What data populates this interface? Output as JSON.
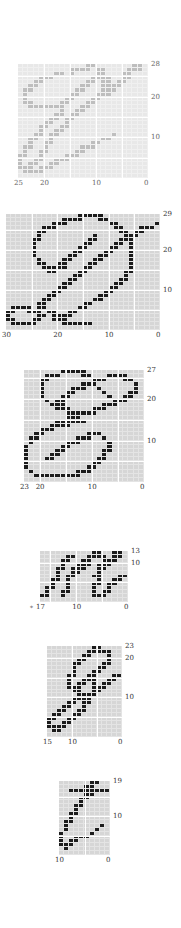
{
  "figure": {
    "colors": {
      "background": "#ffffff",
      "grid_bg": "#d6d6d6",
      "grid_line": "#ffffff",
      "ink": "#1c1c1c",
      "faded_ink": "#8a8a8a"
    },
    "panels": [
      {
        "id": "g1",
        "faded": true,
        "cols": 25,
        "rows": 28,
        "x": 18,
        "y": 64,
        "w": 130,
        "h": 114,
        "x_ticks": [
          "25",
          "20",
          "10",
          "0"
        ],
        "y_ticks": [
          "28",
          "20",
          "10"
        ],
        "bitmap": [
          ".............XX.......XX.",
          "..........XXXX.XX....XXX.",
          ".......XX.X....XX...XX...",
          "....XXX.......XXXX..XX...",
          "...XX........XX.XX.XX....",
          "..XX........XX..XXXX.....",
          ".XX........XX...XXX......",
          ".X........XX...XXX.......",
          ".X.......XX...XX.........",
          ".XX.....XX...XX..........",
          "..XXXXXXX...XX...........",
          "........X..XX............",
          ".......XX.XX.............",
          "......XX.XX..............",
          ".....XX..X...............",
          "....XX..XX...............",
          "....X..XX................",
          "...XX.XX..........X......",
          "..XX..X.........XX.......",
          "..X..XX.......XX.........",
          ".XX..X......XXX..........",
          ".X..XX.....XX............",
          "XX..X....XXX.............",
          "X..XX..XXX...............",
          "X.XX..XX.................",
          "XXX.XXX..................",
          ".XXXX....................",
          "........................."
        ]
      },
      {
        "id": "g2",
        "faded": false,
        "cols": 30,
        "rows": 29,
        "x": 6,
        "y": 214,
        "w": 154,
        "h": 116,
        "x_ticks": [
          "30",
          "20",
          "10",
          "0"
        ],
        "y_ticks": [
          "29",
          "20",
          "10"
        ],
        "bitmap": [
          "..............XXXXX...........",
          "...........XXXX...XX..........",
          ".........XXX........XX.......X",
          ".......XXX...........XX...XXX.",
          "......XX..............XX.XX...",
          "......X..........X.....XXX....",
          ".....XX.........XX....XXX.....",
          ".....X.........XX....XX.X.....",
          ".....X........XX....XX..X.....",
          ".....X.......XX....XX...X.....",
          ".....X......XX....XX....X.....",
          "......X....XX....XX.....X.....",
          "......XX..XX....XX......X.....",
          ".......XXXXX...XX.......X.....",
          "........XX....XX.......XX.....",
          ".............XX........X......",
          "............XX........XX......",
          "...........XX........XX.......",
          "..........XX........XX........",
          ".........XX........XX.........",
          "........XX........XX..........",
          ".......XX........XX...........",
          "......XX.......XX.............",
          ".XXXX.XX......XX..............",
          "XX..XXX.XX..XX................",
          "X.....XX.XXXX.................",
          "XX...XX..XXX..................",
          ".XXXXX.....XXXXXX.............",
          ".............................."
        ]
      },
      {
        "id": "g3",
        "faded": false,
        "cols": 23,
        "rows": 27,
        "x": 24,
        "y": 370,
        "w": 120,
        "h": 112,
        "x_ticks": [
          "23",
          "20",
          "10",
          "0"
        ],
        "y_ticks": [
          "27",
          "20",
          "10"
        ],
        "bitmap": [
          ".......XXXXX...........",
          "....XXX....XX...XXXX...",
          "...XX........XXX...XX..",
          "...X.......XXX.......X.",
          "...X.....XXX..X......X.",
          "...X....XX.....X....XX.",
          "...X...XX.......X..XX..",
          "....X.XX.........XXX...",
          ".....XXX.......XXX.....",
          "......XXX....XXX.......",
          "........XXXXXX.........",
          "........XXX............",
          "......XXXXXX...........",
          ".....XXXX..............",
          "...XXX.................",
          "..XX........XXX........",
          ".XX.......XXX..X.......",
          ".X......XXX.....X......",
          "X......XX.......X......",
          "X.....XX.......XX......",
          "X....XX........X.......",
          "X...XX........XX.......",
          "X............XX........",
          "X...........XX.........",
          ".X........XXX..........",
          "..XXXXXXXXX............",
          "......................."
        ]
      },
      {
        "id": "g4",
        "faded": false,
        "cols": 17,
        "rows": 13,
        "x": 40,
        "y": 551,
        "w": 88,
        "h": 51,
        "x_ticks": [
          "17",
          "10",
          "0"
        ],
        "y_ticks": [
          "13",
          "10"
        ],
        "star": "*",
        "bitmap": [
          "..........XX..XX.",
          ".....XX..XXXX.XX.",
          "....XX..XX..XXX..",
          "....X..XXX.XXX...",
          "...XX.XXX..XX....",
          "...X..XX...X.....",
          "...X.XX...XX...XX",
          "..XX.X.....X..XX.",
          "..X..X....XX.XX..",
          ".XX..X....X..X...",
          ".X..XX....X.XX...",
          "XX..X.....XXX....",
          "................."
        ]
      },
      {
        "id": "g5",
        "faded": false,
        "cols": 15,
        "rows": 23,
        "x": 47,
        "y": 646,
        "w": 75,
        "h": 91,
        "x_ticks": [
          "15",
          "10",
          "0"
        ],
        "y_ticks": [
          "23",
          "20"
        ],
        "y_ticks_lower": [
          "10"
        ],
        "bitmap": [
          ".........XX....",
          "........XXXXX..",
          ".......XX...X..",
          "......XX....X..",
          ".....XX....XX..",
          ".....X....XX...",
          ".....X...XX....",
          "....XX..XX...XX",
          "....X..XXX..XX.",
          "....X.XX.X.XX..",
          "....XXX..XXX...",
          ".....XX..XX....",
          "......XXXX.....",
          ".....XXXX......",
          "....XX.XX......",
          "...XX..X.......",
          "..XX..XX.......",
          ".XX..XX........",
          "XX..XX.........",
          "X..XX..........",
          "XXXX...........",
          ".XX............",
          "..............."
        ]
      },
      {
        "id": "g6",
        "faded": false,
        "cols": 10,
        "rows": 19,
        "x": 59,
        "y": 781,
        "w": 51,
        "h": 74,
        "x_ticks": [
          "10",
          "0"
        ],
        "y_ticks": [
          "19",
          "10"
        ],
        "bitmap": [
          "......XX..",
          ".....XX...",
          "..XXXXXXXX",
          ".....XX...",
          "....XX....",
          "....X.....",
          "...XX.....",
          "...X......",
          "..XX......",
          "..X.......",
          ".XX.......",
          ".X......X.",
          ".X.....X..",
          "X.....X...",
          "X..XXX....",
          "X.XX......",
          "XXX.......",
          ".X........",
          ".........."
        ]
      }
    ]
  }
}
